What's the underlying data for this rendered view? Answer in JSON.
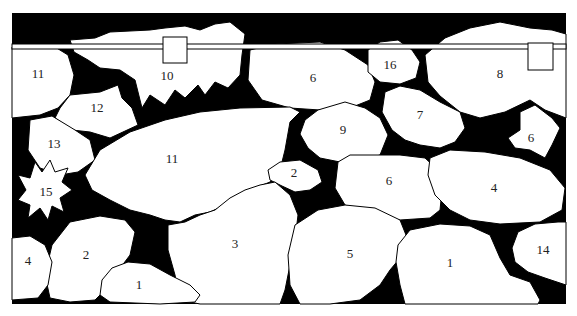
{
  "diagram": {
    "background_color": "#000000",
    "stone_color": "#ffffff",
    "frame": {
      "x": 12,
      "y": 13,
      "width": 554,
      "height": 291
    },
    "rail": {
      "y": 46,
      "markers": [
        {
          "x": 175,
          "y": 50
        },
        {
          "x": 541,
          "y": 57
        }
      ]
    },
    "stones": [
      {
        "id": "s11a",
        "label": "11",
        "lx": 38,
        "ly": 75
      },
      {
        "id": "s10",
        "label": "10",
        "lx": 167,
        "ly": 77
      },
      {
        "id": "s6a",
        "label": "6",
        "lx": 313,
        "ly": 79
      },
      {
        "id": "s16",
        "label": "16",
        "lx": 390,
        "ly": 66
      },
      {
        "id": "s8",
        "label": "8",
        "lx": 500,
        "ly": 75
      },
      {
        "id": "s12",
        "label": "12",
        "lx": 97,
        "ly": 109
      },
      {
        "id": "s7",
        "label": "7",
        "lx": 420,
        "ly": 116
      },
      {
        "id": "s9",
        "label": "9",
        "lx": 343,
        "ly": 131
      },
      {
        "id": "s6b",
        "label": "6",
        "lx": 531,
        "ly": 139
      },
      {
        "id": "s13",
        "label": "13",
        "lx": 54,
        "ly": 145
      },
      {
        "id": "s11b",
        "label": "11",
        "lx": 172,
        "ly": 160
      },
      {
        "id": "s2a",
        "label": "2",
        "lx": 294,
        "ly": 174
      },
      {
        "id": "s6c",
        "label": "6",
        "lx": 389,
        "ly": 182
      },
      {
        "id": "s4a",
        "label": "4",
        "lx": 494,
        "ly": 189
      },
      {
        "id": "s15",
        "label": "15",
        "lx": 46,
        "ly": 193
      },
      {
        "id": "s3",
        "label": "3",
        "lx": 235,
        "ly": 245
      },
      {
        "id": "s2b",
        "label": "2",
        "lx": 86,
        "ly": 256
      },
      {
        "id": "s5",
        "label": "5",
        "lx": 350,
        "ly": 255
      },
      {
        "id": "s14",
        "label": "14",
        "lx": 543,
        "ly": 251
      },
      {
        "id": "s4b",
        "label": "4",
        "lx": 28,
        "ly": 262
      },
      {
        "id": "s1b",
        "label": "1",
        "lx": 450,
        "ly": 264
      },
      {
        "id": "s1a",
        "label": "1",
        "lx": 139,
        "ly": 286
      }
    ]
  }
}
